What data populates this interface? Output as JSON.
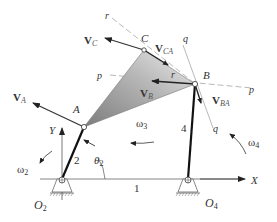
{
  "diagram": {
    "type": "fourbar-linkage-velocity",
    "points": {
      "A": {
        "label": "A"
      },
      "B": {
        "label": "B"
      },
      "C": {
        "label": "C"
      },
      "O2": {
        "label": "O",
        "sub": "2"
      },
      "O4": {
        "label": "O",
        "sub": "4"
      }
    },
    "links": {
      "ground": "1",
      "crank": "2",
      "rocker": "4"
    },
    "axes": {
      "x": "X",
      "y": "Y"
    },
    "angle": {
      "label": "θ",
      "sub": "2"
    },
    "angular_velocities": {
      "w2": {
        "label": "ω",
        "sub": "2"
      },
      "w3": {
        "label": "ω",
        "sub": "3"
      },
      "w4": {
        "label": "ω",
        "sub": "4"
      }
    },
    "velocities": {
      "VA": {
        "label": "V",
        "sub": "A"
      },
      "VB": {
        "label": "V",
        "sub": "B"
      },
      "VC": {
        "label": "V",
        "sub": "C"
      },
      "VCA": {
        "label": "V",
        "sub": "CA"
      },
      "VBA": {
        "label": "V",
        "sub": "BA"
      }
    },
    "construction_lines": {
      "p1": "p",
      "p2": "p",
      "q1": "q",
      "q2": "q",
      "r1": "r",
      "r2": "r"
    },
    "colors": {
      "line": "#333333",
      "link": "#111111",
      "coupler_fill_dark": "#8a8a8a",
      "coupler_fill_light": "#e6e6e6",
      "construction": "#9a9a9a"
    }
  }
}
